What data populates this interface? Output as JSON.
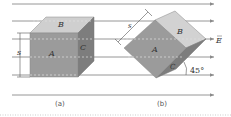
{
  "diagram": {
    "type": "electric-field-through-cube",
    "field_label": "E",
    "field_direction": "right",
    "field_line_color": "#8a8a8a",
    "cube_colors": {
      "front": "#9a9a9a",
      "top": "#cfcfcf",
      "side": "#7a7a7a"
    },
    "panel_a": {
      "caption": "(a)",
      "faces": {
        "front": "A",
        "top": "B",
        "side": "C"
      },
      "dimension_label": "s"
    },
    "panel_b": {
      "caption": "(b)",
      "faces": {
        "front": "A",
        "top": "B",
        "side": "C"
      },
      "dimension_label": "s",
      "angle_label": "45°"
    }
  }
}
